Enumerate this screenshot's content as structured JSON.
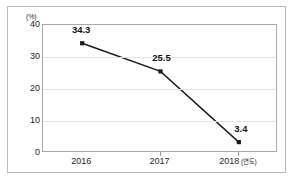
{
  "chart_data": {
    "type": "line",
    "title": "",
    "subtitle": "",
    "xlabel": "(연도)",
    "ylabel": "(%)",
    "categories": [
      "2016",
      "2017",
      "2018"
    ],
    "values": [
      34.3,
      25.5,
      3.4
    ],
    "point_labels": [
      "34.3",
      "25.5",
      "3.4"
    ],
    "ylim": [
      0,
      40
    ],
    "yticks": [
      "0",
      "10",
      "20",
      "30",
      "40"
    ],
    "ytick_values": [
      0,
      10,
      20,
      30,
      40
    ],
    "grid": "horizontal",
    "legend": "none",
    "series": [
      {
        "name": "",
        "values": [
          34.3,
          25.5,
          3.4
        ],
        "line_color": "#1a1a1a",
        "marker": "square",
        "marker_color": "#1a1a1a"
      }
    ]
  },
  "axes": {
    "unit_label": "(%)",
    "x_suffix": "(연도)",
    "y_ticks": [
      {
        "label": "40",
        "value": 40
      },
      {
        "label": "30",
        "value": 30
      },
      {
        "label": "20",
        "value": 20
      },
      {
        "label": "10",
        "value": 10
      },
      {
        "label": "0",
        "value": 0
      }
    ],
    "x_ticks": [
      {
        "label": "2016",
        "value": 34.3,
        "point_label": "34.3"
      },
      {
        "label": "2017",
        "value": 25.5,
        "point_label": "25.5"
      },
      {
        "label": "2018",
        "value": 3.4,
        "point_label": "3.4"
      }
    ]
  },
  "colors": {
    "line": "#1a1a1a",
    "marker": "#1a1a1a",
    "grid": "#e3e3e3",
    "plot_border": "#a8a8a8",
    "outer_frame": "#b9b9b9",
    "text": "#1d1d1d",
    "background": "#ffffff"
  }
}
